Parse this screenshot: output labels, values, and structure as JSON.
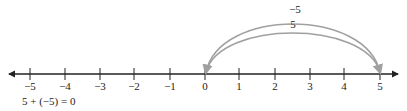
{
  "number_line": {
    "ticks": [
      {
        "value": -5,
        "label": "−5",
        "x": 30
      },
      {
        "value": -4,
        "label": "−4",
        "x": 65
      },
      {
        "value": -3,
        "label": "−3",
        "x": 100
      },
      {
        "value": -2,
        "label": "−2",
        "x": 134
      },
      {
        "value": -1,
        "label": "−1",
        "x": 170
      },
      {
        "value": 0,
        "label": "0",
        "x": 205
      },
      {
        "value": 1,
        "label": "1",
        "x": 239
      },
      {
        "value": 2,
        "label": "2",
        "x": 275
      },
      {
        "value": 3,
        "label": "3",
        "x": 310
      },
      {
        "value": 4,
        "label": "4",
        "x": 344
      },
      {
        "value": 5,
        "label": "5",
        "x": 380
      }
    ]
  },
  "arcs": [
    {
      "label": "−5",
      "from": 5,
      "to": 0,
      "description": "outer arc from 5 back to 0"
    },
    {
      "label": "5",
      "from": 0,
      "to": 5,
      "description": "inner arc from 0 to 5"
    }
  ],
  "equation": "5 + (−5) = 0",
  "colors": {
    "axis": "#222222",
    "arc": "#a0a0a0"
  }
}
